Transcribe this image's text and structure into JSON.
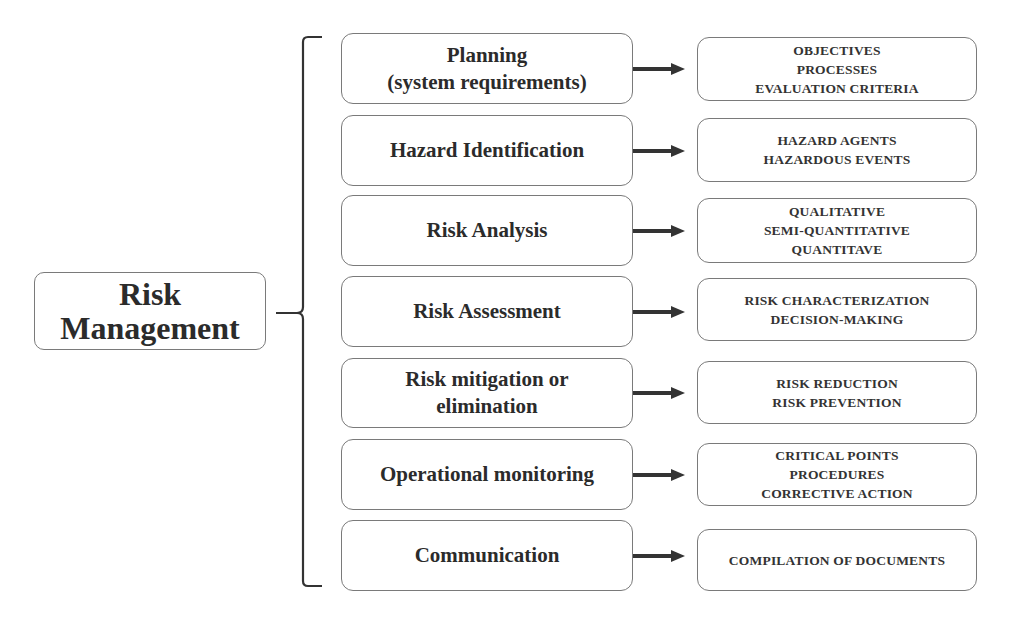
{
  "diagram": {
    "root": {
      "lines": [
        "Risk",
        "Management"
      ]
    },
    "steps": [
      {
        "label_lines": [
          "Planning",
          "(system requirements)"
        ],
        "details": [
          "OBJECTIVES",
          "PROCESSES",
          "EVALUATION CRITERIA"
        ],
        "mid_top": 33,
        "mid_h": 71,
        "right_top": 37,
        "right_h": 64
      },
      {
        "label_lines": [
          "Hazard Identification"
        ],
        "details": [
          "HAZARD AGENTS",
          "HAZARDOUS EVENTS"
        ],
        "mid_top": 115,
        "mid_h": 71,
        "right_top": 118,
        "right_h": 64
      },
      {
        "label_lines": [
          "Risk Analysis"
        ],
        "details": [
          "QUALITATIVE",
          "SEMI-QUANTITATIVE",
          "QUANTITAVE"
        ],
        "mid_top": 195,
        "mid_h": 71,
        "right_top": 198,
        "right_h": 65
      },
      {
        "label_lines": [
          "Risk Assessment"
        ],
        "details": [
          "RISK CHARACTERIZATION",
          "DECISION-MAKING"
        ],
        "mid_top": 276,
        "mid_h": 71,
        "right_top": 278,
        "right_h": 63
      },
      {
        "label_lines": [
          "Risk mitigation or",
          "elimination"
        ],
        "details": [
          "RISK REDUCTION",
          "RISK PREVENTION"
        ],
        "mid_top": 358,
        "mid_h": 70,
        "right_top": 361,
        "right_h": 63
      },
      {
        "label_lines": [
          "Operational monitoring"
        ],
        "details": [
          "CRITICAL POINTS",
          "PROCEDURES",
          "CORRECTIVE ACTION"
        ],
        "mid_top": 439,
        "mid_h": 71,
        "right_top": 443,
        "right_h": 63
      },
      {
        "label_lines": [
          "Communication"
        ],
        "details": [
          "COMPILATION OF DOCUMENTS"
        ],
        "mid_top": 520,
        "mid_h": 71,
        "right_top": 529,
        "right_h": 62
      }
    ],
    "colors": {
      "border": "#7a7a7a",
      "text": "#2b2b2b",
      "arrow": "#333333",
      "bracket": "#333333"
    }
  }
}
